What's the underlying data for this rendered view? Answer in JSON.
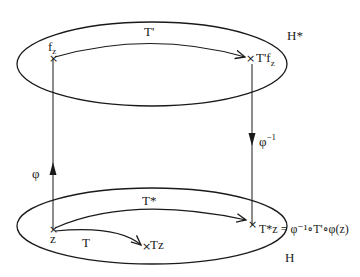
{
  "diagram": {
    "top_space": {
      "label": "H*"
    },
    "bottom_space": {
      "label": "H"
    },
    "points": {
      "f_z": {
        "main": "f",
        "sub": "z"
      },
      "tprime_fz": {
        "main": "T'f",
        "sub": "z"
      },
      "z": {
        "label": "z"
      },
      "tz": {
        "label": "Tz"
      },
      "tstar_z": {
        "label": "T*z = φ⁻¹∘T'∘φ(z)"
      }
    },
    "arrows": {
      "t_prime": {
        "label": "T'"
      },
      "t_star": {
        "label": "T*"
      },
      "t": {
        "label": "T"
      },
      "phi": {
        "label": "φ"
      },
      "phi_inverse": {
        "main": "φ",
        "sup": "−1"
      }
    },
    "marker_symbol": "×",
    "colors": {
      "ink": "#1a1a1a",
      "background": "#ffffff"
    }
  }
}
